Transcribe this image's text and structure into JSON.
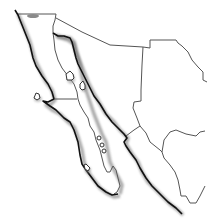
{
  "map": {
    "title": "",
    "subject": "Northwestern Mexico outline map",
    "background": "#ffffff",
    "coast_color": "#111111",
    "border_color": "#555555",
    "shadow_color": "#666666",
    "regions": [
      {
        "id": "baja-california",
        "label": ""
      },
      {
        "id": "baja-california-sur",
        "label": ""
      },
      {
        "id": "sonora",
        "label": ""
      },
      {
        "id": "chihuahua",
        "label": ""
      },
      {
        "id": "sinaloa",
        "label": ""
      },
      {
        "id": "durango",
        "label": ""
      }
    ],
    "features": {
      "islands": [
        "isla-angel-de-la-guarda",
        "isla-tiburon",
        "isla-cedros",
        "gulf-islets",
        "isla-magdalena"
      ],
      "lake": "laguna-salada"
    }
  }
}
